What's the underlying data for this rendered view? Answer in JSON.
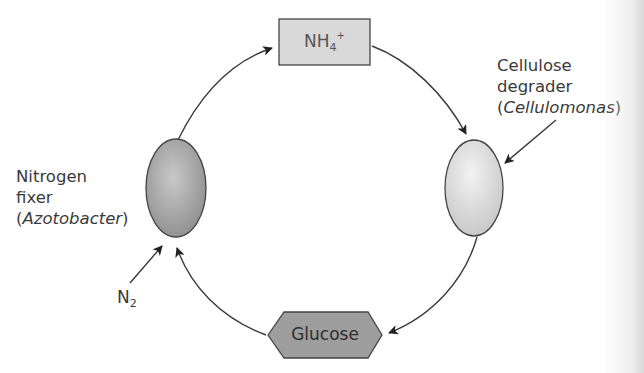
{
  "diagram": {
    "type": "cycle",
    "nodes": {
      "ammonium": {
        "label": "NH",
        "subscript": "4",
        "superscript": "+",
        "shape": "rectangle",
        "fill": "#d9d9d9"
      },
      "glucose": {
        "label": "Glucose",
        "shape": "hexagon",
        "fill": "#9e9e9e"
      },
      "nitrogen_fixer": {
        "line1": "Nitrogen",
        "line2": "fixer",
        "paren_open": "(",
        "genus": "Azotobacter",
        "paren_close": ")",
        "shape": "ellipse",
        "fill": "#a8a8a8"
      },
      "cellulose_degrader": {
        "line1": "Cellulose",
        "line2": "degrader",
        "paren_open": "(",
        "genus": "Cellulomonas",
        "paren_close": ")",
        "shape": "ellipse",
        "fill": "#dcdcdc"
      },
      "nitrogen_gas": {
        "label": "N",
        "subscript": "2"
      }
    },
    "edges": [
      {
        "from": "nitrogen_fixer",
        "to": "ammonium"
      },
      {
        "from": "ammonium",
        "to": "cellulose_degrader"
      },
      {
        "from": "cellulose_degrader",
        "to": "glucose"
      },
      {
        "from": "glucose",
        "to": "nitrogen_fixer"
      },
      {
        "from": "nitrogen_gas",
        "to": "nitrogen_fixer"
      },
      {
        "from": "cellulose_degrader_label",
        "to": "cellulose_degrader"
      }
    ],
    "colors": {
      "stroke": "#3a3a3a",
      "text": "#3a3a3a"
    }
  }
}
